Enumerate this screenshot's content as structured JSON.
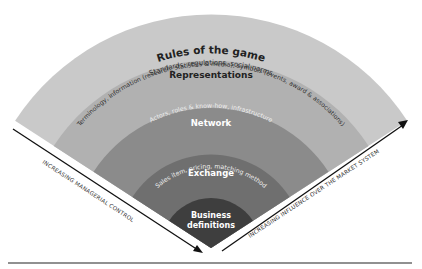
{
  "diagram": {
    "type": "concentric-fan",
    "layers": [
      {
        "id": "rules",
        "title": "Rules of the game",
        "subtitle": "Standards, regulations, social norms",
        "color": "#c9c9c9",
        "title_color": "#222222",
        "sub_color": "#333333"
      },
      {
        "id": "representations",
        "title": "Representations",
        "subtitle": "Terminology, information (research, statistics & media), symbols (events, award & associations)",
        "color": "#b1b1b1",
        "title_color": "#222222",
        "sub_color": "#333333"
      },
      {
        "id": "network",
        "title": "Network",
        "subtitle": "Actors, roles & know-how, infrastructure",
        "color": "#8b8b8b",
        "title_color": "#ffffff",
        "sub_color": "#eeeeee"
      },
      {
        "id": "exchange",
        "title": "Exchange",
        "subtitle": "Sales item, pricing, matching method",
        "color": "#6f6f6f",
        "title_color": "#ffffff",
        "sub_color": "#eeeeee"
      },
      {
        "id": "business",
        "title": "Business",
        "title2": "definitions",
        "color": "#3e3e3e",
        "title_color": "#ffffff"
      }
    ],
    "axes": {
      "left": "INCREASING MANAGERIAL CONTROL",
      "right": "INCREASING INFLUENCE OVER THE MARKET SYSTEM"
    }
  }
}
